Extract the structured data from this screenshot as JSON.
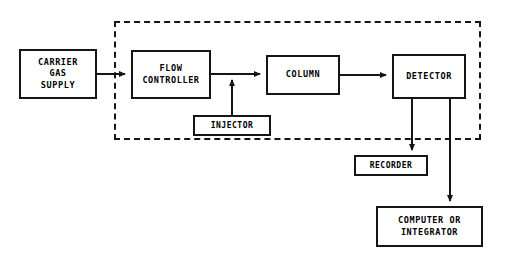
{
  "diagram": {
    "background_color": "#ffffff",
    "stroke_color": "#151515",
    "oven": {
      "label": "oven-boundary",
      "style": "dashed",
      "x": 114,
      "y": 21,
      "width": 367,
      "height": 119
    },
    "nodes": [
      {
        "id": "carrier-gas-supply",
        "lines": [
          "CARRIER",
          "GAS",
          "SUPPLY"
        ],
        "x": 19,
        "y": 49,
        "width": 78,
        "height": 50
      },
      {
        "id": "flow-controller",
        "lines": [
          "FLOW",
          "CONTROLLER"
        ],
        "x": 131,
        "y": 50,
        "width": 80,
        "height": 49
      },
      {
        "id": "injector",
        "lines": [
          "INJECTOR"
        ],
        "x": 193,
        "y": 115,
        "width": 78,
        "height": 21
      },
      {
        "id": "column",
        "lines": [
          "COLUMN"
        ],
        "x": 266,
        "y": 55,
        "width": 74,
        "height": 40
      },
      {
        "id": "detector",
        "lines": [
          "DETECTOR"
        ],
        "x": 392,
        "y": 54,
        "width": 74,
        "height": 45
      },
      {
        "id": "recorder",
        "lines": [
          "RECORDER"
        ],
        "x": 354,
        "y": 155,
        "width": 74,
        "height": 21
      },
      {
        "id": "computer-or-integrator",
        "lines": [
          "COMPUTER OR",
          "INTEGRATOR"
        ],
        "x": 376,
        "y": 206,
        "width": 107,
        "height": 41
      }
    ],
    "connections": [
      {
        "id": "carrier-gas-to-flow-controller",
        "from": "carrier-gas-supply",
        "to": "flow-controller",
        "arrow": true
      },
      {
        "id": "flow-controller-to-column",
        "from": "flow-controller",
        "to": "column",
        "arrow": true
      },
      {
        "id": "injector-to-flow-line",
        "from": "injector",
        "to": "flow-controller-outlet",
        "arrow": true
      },
      {
        "id": "column-to-detector",
        "from": "column",
        "to": "detector",
        "arrow": true
      },
      {
        "id": "detector-to-recorder",
        "from": "detector",
        "to": "recorder",
        "arrow": true
      },
      {
        "id": "detector-to-computer",
        "from": "detector",
        "to": "computer-or-integrator",
        "arrow": true
      }
    ]
  }
}
